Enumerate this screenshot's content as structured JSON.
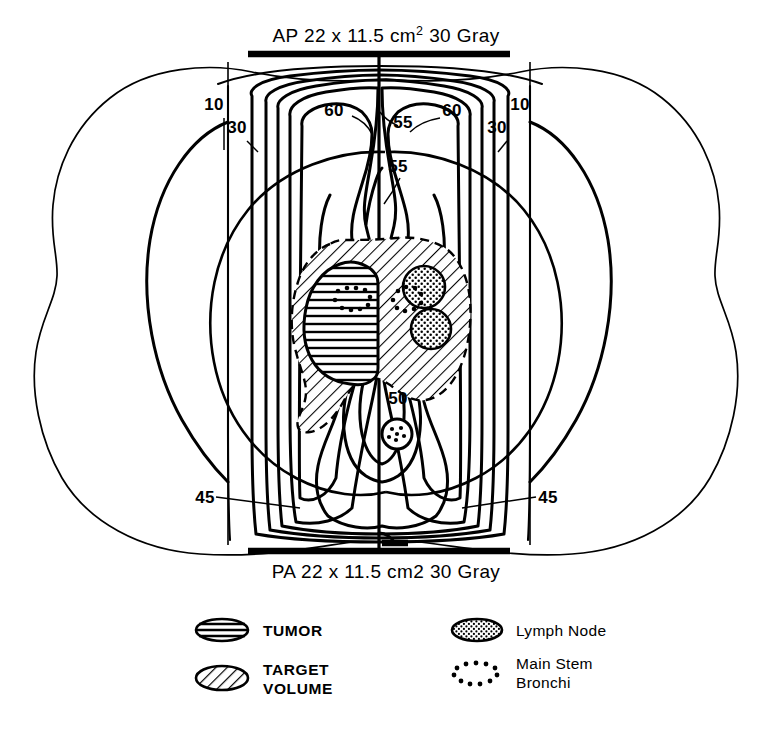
{
  "figure": {
    "type": "radiation-isodose-plan",
    "title_top": "AP 22 x 11.5 cm² 30 Gray",
    "title_bottom": "PA 22 x 11.5 cm2 30 Gray"
  },
  "fields": {
    "ap": {
      "technique": "AP",
      "width_cm": "22",
      "height_cm": "11.5",
      "unit": "cm",
      "exponent": "2",
      "dose": "30 Gray",
      "label_prefix": "AP  22  x  11.5 cm",
      "label_suffix": "  30 Gray"
    },
    "pa": {
      "technique": "PA",
      "width_cm": "22",
      "height_cm": "11.5",
      "unit": "cm2",
      "dose": "30 Gray",
      "label": "PA  22  x  11.5 cm2  30 Gray"
    }
  },
  "isodose_labels": [
    {
      "id": "iso-10-left",
      "value": "10",
      "x": 214,
      "y": 110
    },
    {
      "id": "iso-30-left",
      "value": "30",
      "x": 237,
      "y": 133
    },
    {
      "id": "iso-60-left",
      "value": "60",
      "x": 334,
      "y": 116
    },
    {
      "id": "iso-55-upper",
      "value": "55",
      "x": 400,
      "y": 128
    },
    {
      "id": "iso-60-right",
      "value": "60",
      "x": 443,
      "y": 116
    },
    {
      "id": "iso-30-right",
      "value": "30",
      "x": 497,
      "y": 133
    },
    {
      "id": "iso-10-right",
      "value": "10",
      "x": 518,
      "y": 110
    },
    {
      "id": "iso-55-mid",
      "value": "55",
      "x": 396,
      "y": 170
    },
    {
      "id": "iso-50-lower",
      "value": "50",
      "x": 392,
      "y": 401
    },
    {
      "id": "iso-45-left",
      "value": "45",
      "x": 201,
      "y": 502
    },
    {
      "id": "iso-45-right",
      "value": "45",
      "x": 539,
      "y": 502
    }
  ],
  "isodose_levels": [
    10,
    30,
    45,
    50,
    55,
    60
  ],
  "legend": {
    "items": [
      {
        "id": "tumor",
        "label": "TUMOR",
        "label2": "",
        "swatch": "ellipse-horizontal-lines",
        "style": "caps"
      },
      {
        "id": "target",
        "label": "TARGET",
        "label2": "VOLUME",
        "swatch": "ellipse-diagonal-hatch",
        "style": "caps"
      },
      {
        "id": "lymph-node",
        "label": "Lymph Node",
        "label2": "",
        "swatch": "ellipse-stipple",
        "style": "mixed"
      },
      {
        "id": "main-bronchi",
        "label": "Main Stem",
        "label2": "Bronchi",
        "swatch": "ellipse-dotted-outline",
        "style": "mixed"
      }
    ]
  },
  "structures": {
    "tumor": {
      "name": "Tumor",
      "count": 1
    },
    "target_volume": {
      "name": "Target Volume",
      "count": 1
    },
    "lymph_nodes": {
      "name": "Lymph Node",
      "count": 2
    },
    "bronchi": {
      "name": "Main Stem Bronchi",
      "count": 3
    },
    "lungs": {
      "name": "Lung",
      "count": 2
    },
    "body": {
      "name": "Body contour",
      "count": 1
    }
  },
  "colors": {
    "ink": "#000000",
    "background": "#ffffff"
  }
}
